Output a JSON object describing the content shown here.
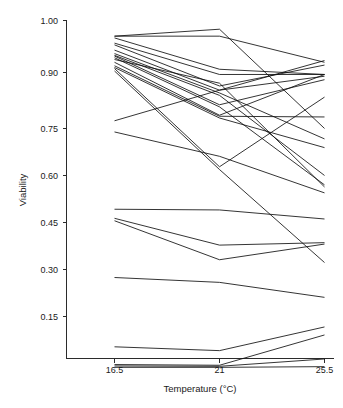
{
  "chart_data": {
    "type": "line",
    "title": "",
    "subtitle": "",
    "xlabel": "Temperature (°C)",
    "ylabel": "Viability",
    "x": [
      16.5,
      21,
      25.5
    ],
    "xtick_labels": [
      "16.5",
      "21",
      "25.5"
    ],
    "ytick_labels": [
      "0.15",
      "0.30",
      "0.45",
      "0.60",
      "0.75",
      "0.90",
      "1.00"
    ],
    "ytick_values": [
      0.15,
      0.3,
      0.45,
      0.6,
      0.75,
      0.9,
      1.0
    ],
    "xlim": [
      15.3,
      26.7
    ],
    "ylim": [
      0.0,
      1.0
    ],
    "grid": false,
    "legend": "none",
    "line_color": "#111111",
    "series": [
      {
        "name": "line-01",
        "values": [
          0.955,
          0.975,
          0.69
        ]
      },
      {
        "name": "line-02",
        "values": [
          0.955,
          0.955,
          0.88
        ]
      },
      {
        "name": "line-03",
        "values": [
          0.95,
          0.86,
          0.845
        ]
      },
      {
        "name": "line-04",
        "values": [
          0.935,
          0.845,
          0.845
        ]
      },
      {
        "name": "line-05",
        "values": [
          0.93,
          0.812,
          0.872
        ]
      },
      {
        "name": "line-06",
        "values": [
          0.915,
          0.8,
          0.84
        ]
      },
      {
        "name": "line-07",
        "values": [
          0.905,
          0.792,
          0.66
        ]
      },
      {
        "name": "line-08",
        "values": [
          0.9,
          0.785,
          0.555
        ]
      },
      {
        "name": "line-09",
        "values": [
          0.898,
          0.758,
          0.83
        ]
      },
      {
        "name": "line-10",
        "values": [
          0.893,
          0.752,
          0.528
        ]
      },
      {
        "name": "line-11",
        "values": [
          0.888,
          0.82,
          0.522
        ]
      },
      {
        "name": "line-12",
        "values": [
          0.88,
          0.728,
          0.845
        ]
      },
      {
        "name": "line-13",
        "values": [
          0.87,
          0.725,
          0.723
        ]
      },
      {
        "name": "line-14",
        "values": [
          0.865,
          0.72,
          0.635
        ]
      },
      {
        "name": "line-15",
        "values": [
          0.862,
          0.58,
          0.78
        ]
      },
      {
        "name": "line-16",
        "values": [
          0.855,
          0.572,
          0.305
        ]
      },
      {
        "name": "line-17",
        "values": [
          0.712,
          0.8,
          0.885
        ]
      },
      {
        "name": "line-18",
        "values": [
          0.68,
          0.61,
          0.505
        ]
      },
      {
        "name": "line-19",
        "values": [
          0.458,
          0.456,
          0.43
        ]
      },
      {
        "name": "line-20",
        "values": [
          0.432,
          0.355,
          0.362
        ]
      },
      {
        "name": "line-21",
        "values": [
          0.425,
          0.313,
          0.358
        ]
      },
      {
        "name": "line-22",
        "values": [
          0.262,
          0.248,
          0.205
        ]
      },
      {
        "name": "line-23",
        "values": [
          0.063,
          0.052,
          0.12
        ]
      },
      {
        "name": "line-24",
        "values": [
          0.012,
          0.01,
          0.097
        ]
      },
      {
        "name": "line-25",
        "values": [
          0.008,
          0.007,
          0.028
        ]
      },
      {
        "name": "line-26",
        "values": [
          0.004,
          0.004,
          0.006
        ]
      }
    ]
  },
  "axes": {
    "y_title": "Viability",
    "x_title": "Temperature (°C)",
    "y_ticks": [
      {
        "label": "1.00",
        "value": 1.0
      },
      {
        "label": "0.90",
        "value": 0.9
      },
      {
        "label": "0.75",
        "value": 0.75
      },
      {
        "label": "0.60",
        "value": 0.6
      },
      {
        "label": "0.45",
        "value": 0.45
      },
      {
        "label": "0.30",
        "value": 0.3
      },
      {
        "label": "0.15",
        "value": 0.15
      }
    ],
    "x_ticks": [
      {
        "label": "16.5",
        "value": 16.5
      },
      {
        "label": "21",
        "value": 21
      },
      {
        "label": "25.5",
        "value": 25.5
      }
    ]
  }
}
